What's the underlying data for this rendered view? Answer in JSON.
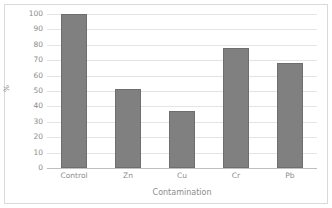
{
  "chart_data": {
    "type": "bar",
    "title": "",
    "categories": [
      "Control",
      "Zn",
      "Cu",
      "Cr",
      "Pb"
    ],
    "values": [
      100,
      51,
      37,
      78,
      68
    ],
    "xlabel": "Contamination",
    "ylabel": "%",
    "ylim": [
      0,
      100
    ],
    "ytick_step": 10,
    "yticks": [
      100,
      90,
      80,
      70,
      60,
      50,
      40,
      30,
      20,
      10,
      0
    ],
    "ytick_labels": [
      "100",
      "90",
      "80",
      "70",
      "60",
      "50",
      "40",
      "30",
      "20",
      "10",
      "0"
    ],
    "grid": true,
    "grid_axis": "y",
    "legend": false,
    "bar_color": "#808080",
    "bar_border_color": "#6e6e6e",
    "grid_color": "#e4e4e4",
    "text_color": "#8c8c8c",
    "background_color": "#ffffff",
    "border_color": "#d9d9d9"
  }
}
